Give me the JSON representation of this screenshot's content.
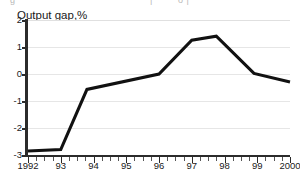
{
  "chart_data": {
    "type": "line",
    "title": "Output gap,%",
    "xlabel": "",
    "ylabel": "",
    "ylim": [
      -3,
      2
    ],
    "xlim": [
      1992,
      2000
    ],
    "grid": true,
    "legend": "none",
    "y_ticks": [
      "2",
      "1",
      "0",
      "-1",
      "-2",
      "-3"
    ],
    "y_tick_values": [
      2,
      1,
      0,
      -1,
      -2,
      -3
    ],
    "x_ticks": [
      "1992",
      "93",
      "94",
      "95",
      "96",
      "97",
      "98",
      "99",
      "2000"
    ],
    "x_tick_values": [
      1992,
      1993,
      1994,
      1995,
      1996,
      1997,
      1998,
      1999,
      2000
    ],
    "minor_tick_interval": 0.25,
    "series": [
      {
        "name": "Output gap",
        "color": "#111111",
        "x": [
          1992.0,
          1993.0,
          1993.8,
          1996.0,
          1997.0,
          1997.75,
          1998.9,
          2000.0
        ],
        "values": [
          -2.85,
          -2.8,
          -0.57,
          0.0,
          1.25,
          1.4,
          0.02,
          -0.3
        ]
      }
    ],
    "annotations": []
  },
  "figure": {
    "title": "Output gap,%",
    "top_artifact": {
      "left": "g",
      "mid": "|",
      "right": "o |"
    }
  },
  "colors": {
    "line": "#111111",
    "axis": "#2b2b2b",
    "grid": "#e6e6e6",
    "background": "#ffffff",
    "text": "#1a1a1a"
  }
}
